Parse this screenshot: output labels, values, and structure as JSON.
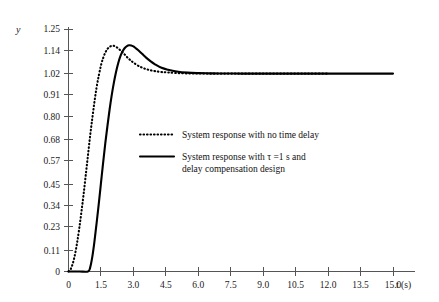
{
  "chart_data": {
    "type": "line",
    "title": "",
    "xlabel": "t (s)",
    "ylabel": "y",
    "xlim": [
      0,
      16.0
    ],
    "ylim": [
      0,
      1.25
    ],
    "grid": false,
    "legend_position": "center",
    "x_ticks": [
      "0",
      "1.5",
      "3.0",
      "4.5",
      "6.0",
      "7.5",
      "9.0",
      "10.5",
      "12.0",
      "13.5",
      "15.0"
    ],
    "x_tick_values": [
      0,
      1.5,
      3.0,
      4.5,
      6.0,
      7.5,
      9.0,
      10.5,
      12.0,
      13.5,
      15.0
    ],
    "y_ticks": [
      "0",
      "0.11",
      "0.23",
      "0.34",
      "0.45",
      "0.57",
      "0.68",
      "0.80",
      "0.91",
      "1.02",
      "1.14",
      "1.25"
    ],
    "y_tick_values": [
      0,
      0.11,
      0.23,
      0.34,
      0.45,
      0.57,
      0.68,
      0.8,
      0.91,
      1.02,
      1.14,
      1.25
    ],
    "series": [
      {
        "name": "System response with no time delay",
        "style": "dotted",
        "color": "#000000",
        "x": [
          0.0,
          0.1,
          0.2,
          0.3,
          0.4,
          0.5,
          0.6,
          0.7,
          0.8,
          0.9,
          1.0,
          1.1,
          1.2,
          1.3,
          1.4,
          1.5,
          1.6,
          1.7,
          1.8,
          1.9,
          2.0,
          2.1,
          2.2,
          2.3,
          2.4,
          2.5,
          2.6,
          2.7,
          2.8,
          2.9,
          3.0,
          3.2,
          3.4,
          3.6,
          3.8,
          4.0,
          4.3,
          4.6,
          5.0,
          5.5,
          6.0,
          6.5,
          7.0,
          7.5,
          8.0,
          9.0,
          10.0,
          11.0,
          12.0
        ],
        "y": [
          0.0,
          0.012,
          0.042,
          0.088,
          0.15,
          0.225,
          0.31,
          0.4,
          0.5,
          0.6,
          0.7,
          0.79,
          0.875,
          0.95,
          1.01,
          1.062,
          1.1,
          1.128,
          1.147,
          1.158,
          1.163,
          1.163,
          1.158,
          1.15,
          1.14,
          1.13,
          1.118,
          1.106,
          1.095,
          1.086,
          1.077,
          1.062,
          1.051,
          1.043,
          1.037,
          1.033,
          1.028,
          1.026,
          1.023,
          1.021,
          1.0205,
          1.02,
          1.02,
          1.02,
          1.02,
          1.02,
          1.02,
          1.02,
          1.02
        ]
      },
      {
        "name": "System response with τ =1 s and delay compensation design",
        "style": "solid",
        "color": "#000000",
        "x": [
          0.0,
          0.5,
          0.9,
          1.0,
          1.1,
          1.2,
          1.3,
          1.4,
          1.5,
          1.6,
          1.7,
          1.8,
          1.9,
          2.0,
          2.1,
          2.2,
          2.3,
          2.4,
          2.5,
          2.6,
          2.7,
          2.8,
          2.9,
          3.0,
          3.1,
          3.2,
          3.4,
          3.6,
          3.8,
          4.0,
          4.3,
          4.6,
          5.0,
          5.5,
          6.0,
          6.5,
          7.0,
          8.0,
          9.0,
          10.0,
          11.0,
          12.0,
          13.0,
          14.0,
          15.0
        ],
        "y": [
          0.0,
          0.0,
          0.0,
          0.02,
          0.075,
          0.155,
          0.25,
          0.35,
          0.455,
          0.56,
          0.66,
          0.75,
          0.835,
          0.91,
          0.975,
          1.03,
          1.075,
          1.11,
          1.135,
          1.152,
          1.162,
          1.166,
          1.165,
          1.16,
          1.152,
          1.143,
          1.122,
          1.101,
          1.083,
          1.068,
          1.05,
          1.04,
          1.031,
          1.025,
          1.0225,
          1.0215,
          1.021,
          1.02,
          1.02,
          1.02,
          1.02,
          1.02,
          1.02,
          1.02,
          1.02
        ]
      }
    ],
    "legend": [
      {
        "style": "dotted",
        "lines": [
          "System response with no time delay"
        ]
      },
      {
        "style": "solid",
        "lines": [
          "System response with τ =1 s and",
          "delay compensation design"
        ]
      }
    ]
  }
}
